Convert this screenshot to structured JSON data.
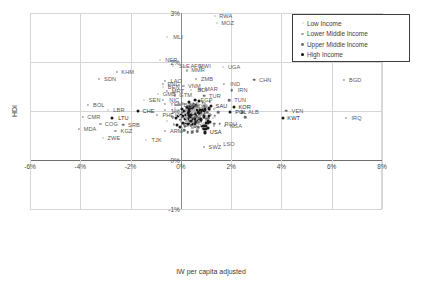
{
  "chart_data": {
    "type": "scatter",
    "title": "",
    "xlabel": "IW per capita adjusted",
    "ylabel": "HDI",
    "xlim": [
      -6,
      8
    ],
    "ylim": [
      -1,
      3
    ],
    "xticks": [
      "-6%",
      "-4%",
      "-2%",
      "0%",
      "2%",
      "4%",
      "6%",
      "8%"
    ],
    "xtick_values": [
      -6,
      -4,
      -2,
      0,
      2,
      4,
      6,
      8
    ],
    "yticks": [
      "3%",
      "2%",
      "1%",
      "0%",
      "-1%"
    ],
    "ytick_values": [
      3,
      2,
      1,
      0,
      -1
    ],
    "grid": true,
    "legend_position": "top-right",
    "legend": [
      {
        "label": "Low Income",
        "marker": "low"
      },
      {
        "label": "Lower Middle Income",
        "marker": "lowermid"
      },
      {
        "label": "Upper Middle Income",
        "marker": "uppermid"
      },
      {
        "label": "High Income",
        "marker": "high"
      }
    ],
    "points": [
      {
        "label": "RWA",
        "x": 1.35,
        "y": 2.93,
        "group": "low"
      },
      {
        "label": "MOZ",
        "x": 1.42,
        "y": 2.8,
        "group": "low"
      },
      {
        "label": "MLI",
        "x": -0.55,
        "y": 2.52,
        "group": "low"
      },
      {
        "label": "NER",
        "x": -0.82,
        "y": 2.05,
        "group": "low"
      },
      {
        "label": "SLE",
        "x": -0.3,
        "y": 1.92,
        "group": "low"
      },
      {
        "label": "AFG",
        "x": 0.18,
        "y": 1.92,
        "group": "low"
      },
      {
        "label": "MWI",
        "x": 0.52,
        "y": 1.92,
        "group": "low"
      },
      {
        "label": "MMR",
        "x": 0.25,
        "y": 1.83,
        "group": "lowermid"
      },
      {
        "label": "UGA",
        "x": 1.68,
        "y": 1.89,
        "group": "low"
      },
      {
        "label": "KHM",
        "x": -2.55,
        "y": 1.8,
        "group": "lowermid"
      },
      {
        "label": "SDN",
        "x": -3.25,
        "y": 1.66,
        "group": "lowermid"
      },
      {
        "label": "ZMB",
        "x": 0.6,
        "y": 1.66,
        "group": "lowermid"
      },
      {
        "label": "CHN",
        "x": 2.92,
        "y": 1.64,
        "group": "uppermid"
      },
      {
        "label": "BGD",
        "x": 6.5,
        "y": 1.64,
        "group": "lowermid"
      },
      {
        "label": "LAO",
        "x": -0.62,
        "y": 1.62,
        "group": "lowermid"
      },
      {
        "label": "PNG",
        "x": -0.72,
        "y": 1.56,
        "group": "lowermid"
      },
      {
        "label": "IND",
        "x": 1.72,
        "y": 1.56,
        "group": "lowermid"
      },
      {
        "label": "BEN",
        "x": -0.72,
        "y": 1.49,
        "group": "low"
      },
      {
        "label": "VNM",
        "x": 0.1,
        "y": 1.51,
        "group": "lowermid"
      },
      {
        "label": "MRT",
        "x": -0.55,
        "y": 1.41,
        "group": "lowermid"
      },
      {
        "label": "BDI",
        "x": 0.42,
        "y": 1.42,
        "group": "low"
      },
      {
        "label": "MAR",
        "x": 0.78,
        "y": 1.44,
        "group": "lowermid"
      },
      {
        "label": "IRN",
        "x": 2.02,
        "y": 1.42,
        "group": "uppermid"
      },
      {
        "label": "GMB",
        "x": -0.9,
        "y": 1.35,
        "group": "low"
      },
      {
        "label": "GTM",
        "x": -0.25,
        "y": 1.32,
        "group": "lowermid"
      },
      {
        "label": "TUR",
        "x": 0.92,
        "y": 1.31,
        "group": "uppermid"
      },
      {
        "label": "SEN",
        "x": -1.48,
        "y": 1.22,
        "group": "low"
      },
      {
        "label": "NIC",
        "x": -0.7,
        "y": 1.22,
        "group": "lowermid"
      },
      {
        "label": "EGP",
        "x": 0.58,
        "y": 1.22,
        "group": "lowermid"
      },
      {
        "label": "TUN",
        "x": 1.92,
        "y": 1.22,
        "group": "uppermid"
      },
      {
        "label": "YEM",
        "x": -0.62,
        "y": 1.14,
        "group": "lowermid"
      },
      {
        "label": "BRA",
        "x": -0.1,
        "y": 1.13,
        "group": "uppermid"
      },
      {
        "label": "MYS",
        "x": 0.38,
        "y": 1.1,
        "group": "uppermid"
      },
      {
        "label": "SAU",
        "x": 1.18,
        "y": 1.1,
        "group": "high"
      },
      {
        "label": "KOR",
        "x": 2.1,
        "y": 1.09,
        "group": "high"
      },
      {
        "label": "BOL",
        "x": -3.7,
        "y": 1.12,
        "group": "lowermid"
      },
      {
        "label": "LBR",
        "x": -2.9,
        "y": 1.03,
        "group": "low"
      },
      {
        "label": "CHE",
        "x": -1.72,
        "y": 1.0,
        "group": "high"
      },
      {
        "label": "PHL",
        "x": -0.95,
        "y": 0.92,
        "group": "lowermid"
      },
      {
        "label": "POL",
        "x": 1.95,
        "y": 0.98,
        "group": "high"
      },
      {
        "label": "ALB",
        "x": 2.45,
        "y": 0.97,
        "group": "uppermid"
      },
      {
        "label": "VEN",
        "x": 4.2,
        "y": 1.01,
        "group": "uppermid"
      },
      {
        "label": "CMR",
        "x": -3.9,
        "y": 0.88,
        "group": "lowermid"
      },
      {
        "label": "LTU",
        "x": -2.72,
        "y": 0.86,
        "group": "high"
      },
      {
        "label": "KWT",
        "x": 4.05,
        "y": 0.86,
        "group": "high"
      },
      {
        "label": "IRQ",
        "x": 6.55,
        "y": 0.86,
        "group": "lowermid"
      },
      {
        "label": "TUR2",
        "x": 2.55,
        "y": 0.87,
        "group": "uppermid"
      },
      {
        "label": "COG",
        "x": -3.2,
        "y": 0.74,
        "group": "lowermid"
      },
      {
        "label": "SRB",
        "x": -2.3,
        "y": 0.72,
        "group": "uppermid"
      },
      {
        "label": "ROU",
        "x": 1.55,
        "y": 0.74,
        "group": "uppermid"
      },
      {
        "label": "NGA",
        "x": 1.75,
        "y": 0.7,
        "group": "lowermid"
      },
      {
        "label": "MDA",
        "x": -4.05,
        "y": 0.64,
        "group": "lowermid"
      },
      {
        "label": "KGZ",
        "x": -2.6,
        "y": 0.6,
        "group": "lowermid"
      },
      {
        "label": "ARM",
        "x": -0.62,
        "y": 0.6,
        "group": "lowermid"
      },
      {
        "label": "USA",
        "x": 0.95,
        "y": 0.58,
        "group": "high"
      },
      {
        "label": "ZWE",
        "x": -3.1,
        "y": 0.44,
        "group": "low"
      },
      {
        "label": "TJK",
        "x": -1.4,
        "y": 0.4,
        "group": "low"
      },
      {
        "label": "SWZ",
        "x": 0.92,
        "y": 0.26,
        "group": "lowermid"
      },
      {
        "label": "LSO",
        "x": 1.48,
        "y": 0.33,
        "group": "low"
      }
    ],
    "cluster_note": "dense unlabeled cluster centered near x=0.6%, y=0.8%"
  }
}
